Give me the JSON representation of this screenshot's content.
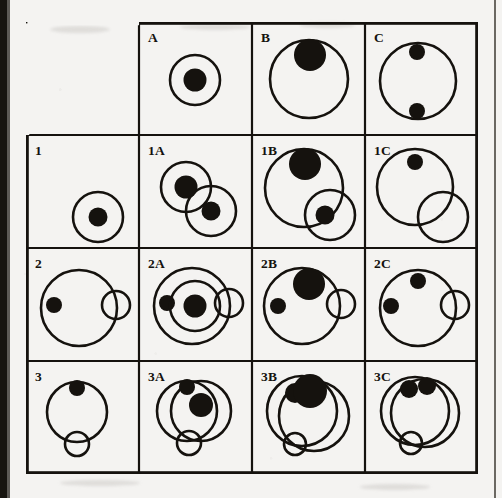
{
  "figure": {
    "type": "matrix-grid-puzzle",
    "rows": 4,
    "columns": 4,
    "cell_size_px": 113,
    "grid_origin_px": [
      26,
      22
    ],
    "stroke_color": "#15120e",
    "fill_color": "#15120e",
    "background_color": "#f4f3f1",
    "page_edge_color": "#17140f"
  },
  "labels": {
    "r0c0": "",
    "r0c1": "A",
    "r0c2": "B",
    "r0c3": "C",
    "r1c0": "1",
    "r1c1": "1A",
    "r1c2": "1B",
    "r1c3": "1C",
    "r2c0": "2",
    "r2c1": "2A",
    "r2c2": "2B",
    "r2c3": "2C",
    "r3c0": "3",
    "r3c1": "3A",
    "r3c2": "3B",
    "r3c3": "3C"
  },
  "chart_data": {
    "type": "diagram-matrix",
    "title": "",
    "grid": {
      "left": 26,
      "top": 22,
      "cell": 113,
      "cols": 4,
      "rows": 4
    },
    "cells": [
      {
        "id": "r0c0",
        "label": "",
        "shapes": []
      },
      {
        "id": "r0c1",
        "label": "A",
        "shapes": [
          {
            "kind": "circle",
            "cx": 56,
            "cy": 58,
            "r": 25,
            "fill": false,
            "sw": 2.6
          },
          {
            "kind": "circle",
            "cx": 56,
            "cy": 58,
            "r": 11.5,
            "fill": true
          }
        ]
      },
      {
        "id": "r0c2",
        "label": "B",
        "shapes": [
          {
            "kind": "circle",
            "cx": 57,
            "cy": 57,
            "r": 39,
            "fill": false,
            "sw": 2.6
          },
          {
            "kind": "circle",
            "cx": 58,
            "cy": 33,
            "r": 16,
            "fill": true
          }
        ]
      },
      {
        "id": "r0c3",
        "label": "C",
        "shapes": [
          {
            "kind": "circle",
            "cx": 53,
            "cy": 59,
            "r": 38,
            "fill": false,
            "sw": 2.6
          },
          {
            "kind": "circle",
            "cx": 52,
            "cy": 30,
            "r": 8,
            "fill": true
          },
          {
            "kind": "circle",
            "cx": 52,
            "cy": 89,
            "r": 8,
            "fill": true
          }
        ]
      },
      {
        "id": "r1c0",
        "label": "1",
        "shapes": [
          {
            "kind": "circle",
            "cx": 72,
            "cy": 82,
            "r": 25,
            "fill": false,
            "sw": 2.6
          },
          {
            "kind": "circle",
            "cx": 72,
            "cy": 82,
            "r": 9.5,
            "fill": true
          }
        ]
      },
      {
        "id": "r1c1",
        "label": "1A",
        "shapes": [
          {
            "kind": "circle",
            "cx": 47,
            "cy": 52,
            "r": 25,
            "fill": false,
            "sw": 2.6
          },
          {
            "kind": "circle",
            "cx": 47,
            "cy": 52,
            "r": 11.5,
            "fill": true
          },
          {
            "kind": "circle",
            "cx": 72,
            "cy": 76,
            "r": 25,
            "fill": false,
            "sw": 2.6
          },
          {
            "kind": "circle",
            "cx": 72,
            "cy": 76,
            "r": 9.5,
            "fill": true
          }
        ]
      },
      {
        "id": "r1c2",
        "label": "1B",
        "shapes": [
          {
            "kind": "circle",
            "cx": 52,
            "cy": 53,
            "r": 39,
            "fill": false,
            "sw": 2.6
          },
          {
            "kind": "circle",
            "cx": 53,
            "cy": 29,
            "r": 16,
            "fill": true
          },
          {
            "kind": "circle",
            "cx": 78,
            "cy": 80,
            "r": 25,
            "fill": false,
            "sw": 2.6
          },
          {
            "kind": "circle",
            "cx": 73,
            "cy": 80,
            "r": 9.5,
            "fill": true
          }
        ]
      },
      {
        "id": "r1c3",
        "label": "1C",
        "shapes": [
          {
            "kind": "circle",
            "cx": 50,
            "cy": 52,
            "r": 38,
            "fill": false,
            "sw": 2.6
          },
          {
            "kind": "circle",
            "cx": 50,
            "cy": 27,
            "r": 8,
            "fill": true
          },
          {
            "kind": "circle",
            "cx": 78,
            "cy": 82,
            "r": 25,
            "fill": false,
            "sw": 2.6
          }
        ]
      },
      {
        "id": "r2c0",
        "label": "2",
        "shapes": [
          {
            "kind": "circle",
            "cx": 53,
            "cy": 60,
            "r": 38,
            "fill": false,
            "sw": 2.6
          },
          {
            "kind": "circle",
            "cx": 28,
            "cy": 57,
            "r": 8,
            "fill": true
          },
          {
            "kind": "circle",
            "cx": 90,
            "cy": 57,
            "r": 14,
            "fill": false,
            "sw": 2.6
          }
        ]
      },
      {
        "id": "r2c1",
        "label": "2A",
        "shapes": [
          {
            "kind": "circle",
            "cx": 53,
            "cy": 58,
            "r": 38,
            "fill": false,
            "sw": 2.6
          },
          {
            "kind": "circle",
            "cx": 28,
            "cy": 55,
            "r": 8,
            "fill": true
          },
          {
            "kind": "circle",
            "cx": 90,
            "cy": 55,
            "r": 14,
            "fill": false,
            "sw": 2.6
          },
          {
            "kind": "circle",
            "cx": 56,
            "cy": 58,
            "r": 25,
            "fill": false,
            "sw": 2.6
          },
          {
            "kind": "circle",
            "cx": 56,
            "cy": 58,
            "r": 11.5,
            "fill": true
          }
        ]
      },
      {
        "id": "r2c2",
        "label": "2B",
        "shapes": [
          {
            "kind": "circle",
            "cx": 50,
            "cy": 58,
            "r": 38,
            "fill": false,
            "sw": 2.6
          },
          {
            "kind": "circle",
            "cx": 26,
            "cy": 58,
            "r": 8,
            "fill": true
          },
          {
            "kind": "circle",
            "cx": 89,
            "cy": 56,
            "r": 14,
            "fill": false,
            "sw": 2.6
          },
          {
            "kind": "circle",
            "cx": 57,
            "cy": 36,
            "r": 16,
            "fill": true
          }
        ]
      },
      {
        "id": "r2c3",
        "label": "2C",
        "shapes": [
          {
            "kind": "circle",
            "cx": 53,
            "cy": 60,
            "r": 38,
            "fill": false,
            "sw": 2.6
          },
          {
            "kind": "circle",
            "cx": 26,
            "cy": 58,
            "r": 8,
            "fill": true
          },
          {
            "kind": "circle",
            "cx": 90,
            "cy": 57,
            "r": 14,
            "fill": false,
            "sw": 2.6
          },
          {
            "kind": "circle",
            "cx": 53,
            "cy": 33,
            "r": 8,
            "fill": true
          }
        ]
      },
      {
        "id": "r3c0",
        "label": "3",
        "shapes": [
          {
            "kind": "circle",
            "cx": 51,
            "cy": 51,
            "r": 30,
            "fill": false,
            "sw": 2.6
          },
          {
            "kind": "circle",
            "cx": 51,
            "cy": 27,
            "r": 8,
            "fill": true
          },
          {
            "kind": "circle",
            "cx": 51,
            "cy": 83,
            "r": 12,
            "fill": false,
            "sw": 2.6
          }
        ]
      },
      {
        "id": "r3c1",
        "label": "3A",
        "shapes": [
          {
            "kind": "circle",
            "cx": 48,
            "cy": 50,
            "r": 30,
            "fill": false,
            "sw": 2.6
          },
          {
            "kind": "circle",
            "cx": 62,
            "cy": 50,
            "r": 30,
            "fill": false,
            "sw": 2.6
          },
          {
            "kind": "circle",
            "cx": 48,
            "cy": 26,
            "r": 8,
            "fill": true
          },
          {
            "kind": "circle",
            "cx": 62,
            "cy": 44,
            "r": 12,
            "fill": true
          },
          {
            "kind": "circle",
            "cx": 50,
            "cy": 82,
            "r": 12,
            "fill": false,
            "sw": 2.6
          }
        ]
      },
      {
        "id": "r3c2",
        "label": "3B",
        "shapes": [
          {
            "kind": "circle",
            "cx": 50,
            "cy": 50,
            "r": 35,
            "fill": false,
            "sw": 2.6
          },
          {
            "kind": "circle",
            "cx": 62,
            "cy": 55,
            "r": 35,
            "fill": false,
            "sw": 2.6
          },
          {
            "kind": "circle",
            "cx": 43,
            "cy": 32,
            "r": 10,
            "fill": true
          },
          {
            "kind": "circle",
            "cx": 58,
            "cy": 30,
            "r": 17,
            "fill": true
          },
          {
            "kind": "circle",
            "cx": 43,
            "cy": 83,
            "r": 11,
            "fill": false,
            "sw": 2.6
          }
        ]
      },
      {
        "id": "r3c3",
        "label": "3C",
        "shapes": [
          {
            "kind": "circle",
            "cx": 50,
            "cy": 50,
            "r": 34,
            "fill": false,
            "sw": 2.6
          },
          {
            "kind": "circle",
            "cx": 60,
            "cy": 52,
            "r": 34,
            "fill": false,
            "sw": 2.6
          },
          {
            "kind": "circle",
            "cx": 44,
            "cy": 28,
            "r": 9,
            "fill": true
          },
          {
            "kind": "circle",
            "cx": 62,
            "cy": 25,
            "r": 9,
            "fill": true
          },
          {
            "kind": "circle",
            "cx": 46,
            "cy": 82,
            "r": 11,
            "fill": false,
            "sw": 2.6
          }
        ]
      }
    ]
  }
}
